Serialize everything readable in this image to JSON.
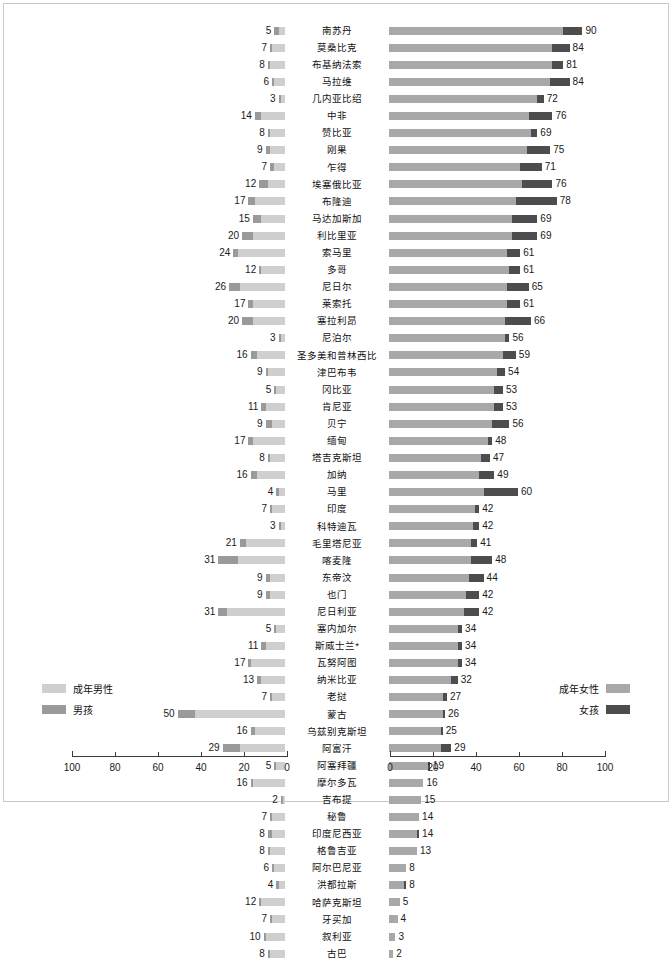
{
  "legend": {
    "left": [
      {
        "label": "成年男性",
        "key": "adult_men",
        "color": "#cfcfcf"
      },
      {
        "label": "男孩",
        "key": "boys",
        "color": "#9a9a9a"
      }
    ],
    "right": [
      {
        "label": "成年女性",
        "key": "adult_women",
        "color": "#a8a8a8"
      },
      {
        "label": "女孩",
        "key": "girls",
        "color": "#4d4d4d"
      }
    ]
  },
  "axes": {
    "left": {
      "ticks": [
        "100",
        "80",
        "60",
        "40",
        "20",
        "0"
      ],
      "min": 0,
      "max": 100,
      "reversed": true
    },
    "right": {
      "ticks": [
        "0",
        "20",
        "40",
        "60",
        "80",
        "100"
      ],
      "min": 0,
      "max": 100,
      "reversed": false
    }
  },
  "chart_data": {
    "type": "bar",
    "subtype": "diverging-stacked-population-pyramid",
    "title": "",
    "xlabel": "",
    "ylabel": "",
    "xlim_left": [
      100,
      0
    ],
    "xlim_right": [
      0,
      100
    ],
    "grid": false,
    "legend_position": "bottom-outer",
    "left_series": [
      {
        "name": "成年男性",
        "color": "#cfcfcf"
      },
      {
        "name": "男孩",
        "color": "#9a9a9a"
      }
    ],
    "right_series": [
      {
        "name": "成年女性",
        "color": "#a8a8a8"
      },
      {
        "name": "女孩",
        "color": "#4d4d4d"
      }
    ],
    "categories": [
      "南苏丹",
      "莫桑比克",
      "布基纳法索",
      "马拉维",
      "几内亚比绍",
      "中非",
      "赞比亚",
      "刚果",
      "乍得",
      "埃塞俄比亚",
      "布隆迪",
      "马达加斯加",
      "利比里亚",
      "索马里",
      "多哥",
      "尼日尔",
      "莱索托",
      "塞拉利昂",
      "尼泊尔",
      "圣多美和普林西比",
      "津巴布韦",
      "冈比亚",
      "肯尼亚",
      "贝宁",
      "缅甸",
      "塔吉克斯坦",
      "加纳",
      "马里",
      "印度",
      "科特迪瓦",
      "毛里塔尼亚",
      "喀麦隆",
      "东帝汶",
      "也门",
      "尼日利亚",
      "塞内加尔",
      "斯威士兰*",
      "瓦努阿图",
      "纳米比亚",
      "老挝",
      "蒙古",
      "乌兹别克斯坦",
      "阿富汗",
      "阿塞拜疆",
      "摩尔多瓦",
      "吉布提",
      "秘鲁",
      "印度尼西亚",
      "格鲁吉亚",
      "阿尔巴尼亚",
      "洪都拉斯",
      "哈萨克斯坦",
      "牙买加",
      "叙利亚",
      "古巴"
    ],
    "rows": [
      {
        "country": "南苏丹",
        "left_total": 5,
        "left_boys": 2,
        "left_men": 3,
        "right_total": 90,
        "right_girls": 9,
        "right_women": 81
      },
      {
        "country": "莫桑比克",
        "left_total": 7,
        "left_boys": 1,
        "left_men": 6,
        "right_total": 84,
        "right_girls": 8,
        "right_women": 76
      },
      {
        "country": "布基纳法索",
        "left_total": 8,
        "left_boys": 1,
        "left_men": 7,
        "right_total": 81,
        "right_girls": 5,
        "right_women": 76
      },
      {
        "country": "马拉维",
        "left_total": 6,
        "left_boys": 1,
        "left_men": 5,
        "right_total": 84,
        "right_girls": 9,
        "right_women": 75
      },
      {
        "country": "几内亚比绍",
        "left_total": 3,
        "left_boys": 1,
        "left_men": 2,
        "right_total": 72,
        "right_girls": 3,
        "right_women": 69
      },
      {
        "country": "中非",
        "left_total": 14,
        "left_boys": 3,
        "left_men": 11,
        "right_total": 76,
        "right_girls": 11,
        "right_women": 65
      },
      {
        "country": "赞比亚",
        "left_total": 8,
        "left_boys": 1,
        "left_men": 7,
        "right_total": 69,
        "right_girls": 3,
        "right_women": 66
      },
      {
        "country": "刚果",
        "left_total": 9,
        "left_boys": 2,
        "left_men": 7,
        "right_total": 75,
        "right_girls": 11,
        "right_women": 64
      },
      {
        "country": "乍得",
        "left_total": 7,
        "left_boys": 2,
        "left_men": 5,
        "right_total": 71,
        "right_girls": 10,
        "right_women": 61
      },
      {
        "country": "埃塞俄比亚",
        "left_total": 12,
        "left_boys": 4,
        "left_men": 8,
        "right_total": 76,
        "right_girls": 14,
        "right_women": 62
      },
      {
        "country": "布隆迪",
        "left_total": 17,
        "left_boys": 3,
        "left_men": 14,
        "right_total": 78,
        "right_girls": 19,
        "right_women": 59
      },
      {
        "country": "马达加斯加",
        "left_total": 15,
        "left_boys": 4,
        "left_men": 11,
        "right_total": 69,
        "right_girls": 12,
        "right_women": 57
      },
      {
        "country": "利比里亚",
        "left_total": 20,
        "left_boys": 5,
        "left_men": 15,
        "right_total": 69,
        "right_girls": 12,
        "right_women": 57
      },
      {
        "country": "索马里",
        "left_total": 24,
        "left_boys": 2,
        "left_men": 22,
        "right_total": 61,
        "right_girls": 6,
        "right_women": 55
      },
      {
        "country": "多哥",
        "left_total": 12,
        "left_boys": 1,
        "left_men": 11,
        "right_total": 61,
        "right_girls": 5,
        "right_women": 56
      },
      {
        "country": "尼日尔",
        "left_total": 26,
        "left_boys": 5,
        "left_men": 21,
        "right_total": 65,
        "right_girls": 10,
        "right_women": 55
      },
      {
        "country": "莱索托",
        "left_total": 17,
        "left_boys": 2,
        "left_men": 15,
        "right_total": 61,
        "right_girls": 6,
        "right_women": 55
      },
      {
        "country": "塞拉利昂",
        "left_total": 20,
        "left_boys": 5,
        "left_men": 15,
        "right_total": 66,
        "right_girls": 12,
        "right_women": 54
      },
      {
        "country": "尼泊尔",
        "left_total": 3,
        "left_boys": 1,
        "left_men": 2,
        "right_total": 56,
        "right_girls": 2,
        "right_women": 54
      },
      {
        "country": "圣多美和普林西比",
        "left_total": 16,
        "left_boys": 3,
        "left_men": 13,
        "right_total": 59,
        "right_girls": 6,
        "right_women": 53
      },
      {
        "country": "津巴布韦",
        "left_total": 9,
        "left_boys": 1,
        "left_men": 8,
        "right_total": 54,
        "right_girls": 4,
        "right_women": 50
      },
      {
        "country": "冈比亚",
        "left_total": 5,
        "left_boys": 1,
        "left_men": 4,
        "right_total": 53,
        "right_girls": 4,
        "right_women": 49
      },
      {
        "country": "肯尼亚",
        "left_total": 11,
        "left_boys": 2,
        "left_men": 9,
        "right_total": 53,
        "right_girls": 4,
        "right_women": 49
      },
      {
        "country": "贝宁",
        "left_total": 9,
        "left_boys": 3,
        "left_men": 6,
        "right_total": 56,
        "right_girls": 8,
        "right_women": 48
      },
      {
        "country": "缅甸",
        "left_total": 17,
        "left_boys": 2,
        "left_men": 15,
        "right_total": 48,
        "right_girls": 2,
        "right_women": 46
      },
      {
        "country": "塔吉克斯坦",
        "left_total": 8,
        "left_boys": 1,
        "left_men": 7,
        "right_total": 47,
        "right_girls": 4,
        "right_women": 43
      },
      {
        "country": "加纳",
        "left_total": 16,
        "left_boys": 3,
        "left_men": 13,
        "right_total": 49,
        "right_girls": 7,
        "right_women": 42
      },
      {
        "country": "马里",
        "left_total": 4,
        "left_boys": 1,
        "left_men": 3,
        "right_total": 60,
        "right_girls": 16,
        "right_women": 44
      },
      {
        "country": "印度",
        "left_total": 7,
        "left_boys": 1,
        "left_men": 6,
        "right_total": 42,
        "right_girls": 2,
        "right_women": 40
      },
      {
        "country": "科特迪瓦",
        "left_total": 3,
        "left_boys": 1,
        "left_men": 2,
        "right_total": 42,
        "right_girls": 3,
        "right_women": 39
      },
      {
        "country": "毛里塔尼亚",
        "left_total": 21,
        "left_boys": 3,
        "left_men": 18,
        "right_total": 41,
        "right_girls": 3,
        "right_women": 38
      },
      {
        "country": "喀麦隆",
        "left_total": 31,
        "left_boys": 9,
        "left_men": 22,
        "right_total": 48,
        "right_girls": 10,
        "right_women": 38
      },
      {
        "country": "东帝汶",
        "left_total": 9,
        "left_boys": 2,
        "left_men": 7,
        "right_total": 44,
        "right_girls": 7,
        "right_women": 37
      },
      {
        "country": "也门",
        "left_total": 9,
        "left_boys": 2,
        "left_men": 7,
        "right_total": 42,
        "right_girls": 6,
        "right_women": 36
      },
      {
        "country": "尼日利亚",
        "left_total": 31,
        "left_boys": 4,
        "left_men": 27,
        "right_total": 42,
        "right_girls": 7,
        "right_women": 35
      },
      {
        "country": "塞内加尔",
        "left_total": 5,
        "left_boys": 1,
        "left_men": 4,
        "right_total": 34,
        "right_girls": 2,
        "right_women": 32
      },
      {
        "country": "斯威士兰*",
        "left_total": 11,
        "left_boys": 2,
        "left_men": 9,
        "right_total": 34,
        "right_girls": 2,
        "right_women": 32
      },
      {
        "country": "瓦努阿图",
        "left_total": 17,
        "left_boys": 1,
        "left_men": 16,
        "right_total": 34,
        "right_girls": 2,
        "right_women": 32
      },
      {
        "country": "纳米比亚",
        "left_total": 13,
        "left_boys": 2,
        "left_men": 11,
        "right_total": 32,
        "right_girls": 3,
        "right_women": 29
      },
      {
        "country": "老挝",
        "left_total": 7,
        "left_boys": 1,
        "left_men": 6,
        "right_total": 27,
        "right_girls": 2,
        "right_women": 25
      },
      {
        "country": "蒙古",
        "left_total": 50,
        "left_boys": 8,
        "left_men": 42,
        "right_total": 26,
        "right_girls": 1,
        "right_women": 25
      },
      {
        "country": "乌兹别克斯坦",
        "left_total": 16,
        "left_boys": 2,
        "left_men": 14,
        "right_total": 25,
        "right_girls": 1,
        "right_women": 24
      },
      {
        "country": "阿富汗",
        "left_total": 29,
        "left_boys": 8,
        "left_men": 21,
        "right_total": 29,
        "right_girls": 5,
        "right_women": 24
      },
      {
        "country": "阿塞拜疆",
        "left_total": 5,
        "left_boys": 1,
        "left_men": 4,
        "right_total": 19,
        "right_girls": 1,
        "right_women": 18
      },
      {
        "country": "摩尔多瓦",
        "left_total": 16,
        "left_boys": 1,
        "left_men": 15,
        "right_total": 16,
        "right_girls": 0,
        "right_women": 16
      },
      {
        "country": "吉布提",
        "left_total": 2,
        "left_boys": 1,
        "left_men": 1,
        "right_total": 15,
        "right_girls": 0,
        "right_women": 15
      },
      {
        "country": "秘鲁",
        "left_total": 7,
        "left_boys": 1,
        "left_men": 6,
        "right_total": 14,
        "right_girls": 0,
        "right_women": 14
      },
      {
        "country": "印度尼西亚",
        "left_total": 8,
        "left_boys": 2,
        "left_men": 6,
        "right_total": 14,
        "right_girls": 1,
        "right_women": 13
      },
      {
        "country": "格鲁吉亚",
        "left_total": 8,
        "left_boys": 1,
        "left_men": 7,
        "right_total": 13,
        "right_girls": 0,
        "right_women": 13
      },
      {
        "country": "阿尔巴尼亚",
        "left_total": 6,
        "left_boys": 1,
        "left_men": 5,
        "right_total": 8,
        "right_girls": 0,
        "right_women": 8
      },
      {
        "country": "洪都拉斯",
        "left_total": 4,
        "left_boys": 1,
        "left_men": 3,
        "right_total": 8,
        "right_girls": 1,
        "right_women": 7
      },
      {
        "country": "哈萨克斯坦",
        "left_total": 12,
        "left_boys": 1,
        "left_men": 11,
        "right_total": 5,
        "right_girls": 0,
        "right_women": 5
      },
      {
        "country": "牙买加",
        "left_total": 7,
        "left_boys": 1,
        "left_men": 6,
        "right_total": 4,
        "right_girls": 0,
        "right_women": 4
      },
      {
        "country": "叙利亚",
        "left_total": 10,
        "left_boys": 1,
        "left_men": 9,
        "right_total": 3,
        "right_girls": 0,
        "right_women": 3
      },
      {
        "country": "古巴",
        "left_total": 8,
        "left_boys": 1,
        "left_men": 7,
        "right_total": 2,
        "right_girls": 0,
        "right_women": 2
      }
    ]
  }
}
